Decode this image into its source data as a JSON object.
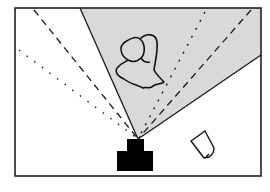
{
  "diagram": {
    "colors": {
      "background": "#ffffff",
      "frame": "#1e1e1e",
      "view_cone_fill": "#d9d9d9",
      "line": "#1a1a1a",
      "camera": "#000000"
    },
    "elements": [
      {
        "id": "frame",
        "label": "scene boundary"
      },
      {
        "id": "view-cone",
        "label": "camera field of view (shaded)"
      },
      {
        "id": "dashed-line-left",
        "label": "dashed sight line (left)",
        "style": "dashed"
      },
      {
        "id": "dotted-line-left",
        "label": "dotted sight line (left)",
        "style": "dotted"
      },
      {
        "id": "dotted-line-right",
        "label": "dotted sight line (right)",
        "style": "dotted"
      },
      {
        "id": "dashed-line-right",
        "label": "dashed sight line (right)",
        "style": "dashed"
      },
      {
        "id": "person",
        "label": "person (top view)"
      },
      {
        "id": "object",
        "label": "small object outside view"
      },
      {
        "id": "camera",
        "label": "camera"
      }
    ]
  }
}
